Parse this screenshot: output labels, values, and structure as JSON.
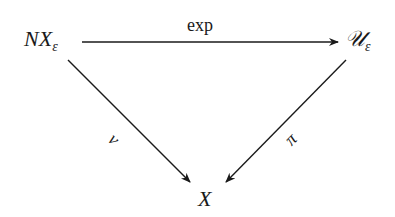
{
  "diagram": {
    "type": "commutative-diagram",
    "nodes": {
      "top_left": {
        "main": "NX",
        "sub": "ε"
      },
      "top_right": {
        "main": "𝒰",
        "sub": "ε"
      },
      "bottom": {
        "main": "X"
      }
    },
    "arrows": {
      "top": {
        "from": "NX_ε",
        "to": "U_ε",
        "label": "exp"
      },
      "left": {
        "from": "NX_ε",
        "to": "X",
        "label": "ν"
      },
      "right": {
        "from": "U_ε",
        "to": "X",
        "label": "π"
      }
    },
    "colors": {
      "ink": "#1a1a1a",
      "background": "#ffffff"
    }
  }
}
